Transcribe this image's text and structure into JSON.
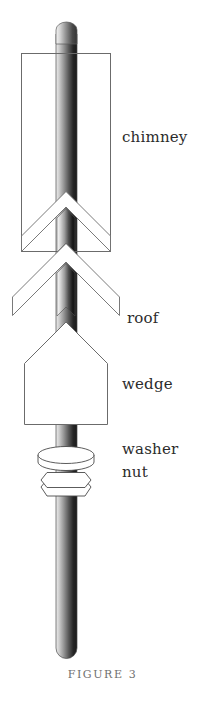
{
  "figure": {
    "caption": "FIGURE 3",
    "background_color": "#ffffff",
    "outline_color": "#6b6b6b",
    "text_color": "#2b2b2b",
    "caption_color": "#6f6f6f"
  },
  "labels": {
    "chimney": "chimney",
    "roof": "roof",
    "wedge": "wedge",
    "washer": "washer",
    "nut": "nut"
  },
  "parts": {
    "rod": {
      "name": "rod",
      "shade_light": "#f2f2f2",
      "shade_mid": "#9a9a9a",
      "shade_dark": "#1d1d1d"
    },
    "chimney": {
      "name": "chimney",
      "fill": "#ffffff"
    },
    "roof_upper": {
      "name": "roof-upper-chevron",
      "fill": "#ffffff"
    },
    "roof_lower": {
      "name": "roof-lower-chevron",
      "fill": "#ffffff"
    },
    "wedge": {
      "name": "wedge",
      "fill": "#ffffff"
    },
    "washer": {
      "name": "washer",
      "fill": "#ffffff"
    },
    "nut": {
      "name": "nut",
      "fill": "#ffffff"
    }
  }
}
